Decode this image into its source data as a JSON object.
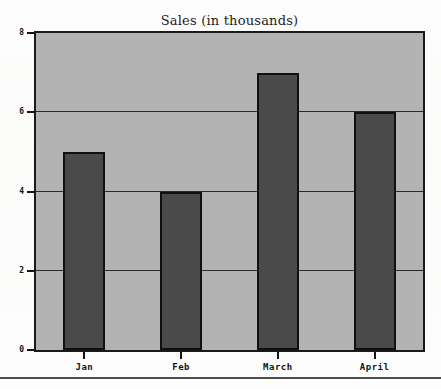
{
  "chart_data": {
    "type": "bar",
    "title": "Sales (in thousands)",
    "xlabel": "",
    "ylabel": "",
    "categories": [
      "Jan",
      "Feb",
      "March",
      "April"
    ],
    "values": [
      5,
      4,
      7,
      6
    ],
    "series": [
      {
        "name": "Sales",
        "values": [
          5,
          4,
          7,
          6
        ]
      }
    ],
    "ylim": [
      0,
      8
    ],
    "yticks": [
      0,
      2,
      4,
      6,
      8
    ],
    "ytick_labels": [
      "0",
      "2",
      "4",
      "6",
      "8"
    ],
    "gridlines": [
      2,
      4,
      6
    ],
    "grid": true,
    "legend": false,
    "legend_position": "none",
    "colors": {
      "bar_fill": "#4a4a4a",
      "bar_edge": "#101010",
      "plot_background": "#b3b3b3",
      "frame": "#1a1a1a",
      "text": "#141414",
      "page_background": "#ffffff",
      "rule": "#4d4d4d"
    }
  }
}
